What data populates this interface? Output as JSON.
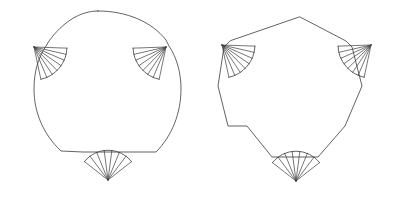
{
  "page": {
    "background_color": "#ffffff",
    "stroke_color": "#3b3b3b",
    "width": 397,
    "height": 198
  },
  "figures": [
    {
      "id": "left-figure",
      "name": "rounded-shield-with-fans",
      "description": "Shield outline with curved top arc and curved sides, three fan pleats",
      "outline_style": "curved",
      "outline_path": "M 98 11 C 127 11 152 22 166 40 L 166 40 L 169 46 C 177 58 181 73 181 89 C 181 113 172 136 156 152 L 133 152 L 83 152 L 61 151 C 43 134 34 112 34 89 C 34 72 38 58 46 46 L 49 41 C 63 22 80 11 98 11 Z",
      "fans": [
        {
          "id": "left-figure-fan-left",
          "name": "fan-upper-left",
          "pivot": [
            34,
            47
          ],
          "radius": 33,
          "start_angle_deg": 2,
          "end_angle_deg": 78,
          "rib_count": 6
        },
        {
          "id": "left-figure-fan-right",
          "name": "fan-upper-right",
          "pivot": [
            166,
            47
          ],
          "radius": 33,
          "start_angle_deg": 102,
          "end_angle_deg": 178,
          "rib_count": 6
        },
        {
          "id": "left-figure-fan-bottom",
          "name": "fan-bottom",
          "pivot": [
            108,
            180
          ],
          "radius": 30,
          "start_angle_deg": 218,
          "end_angle_deg": 322,
          "rib_count": 6
        }
      ]
    },
    {
      "id": "right-figure",
      "name": "angular-shield-with-fans",
      "description": "Shield outline with pointed apex and straight sides, three fan pleats",
      "outline_style": "straight",
      "outline_path": "M 300 17 L 346 41 L 346 41 L 352 47 L 362 86 L 362 86 L 345 126 L 318 157 L 272 157 L 247 126 L 228 126 L 218 86 L 224 47 L 230 41 Z",
      "fans": [
        {
          "id": "right-figure-fan-left",
          "name": "fan-upper-left",
          "pivot": [
            222,
            45
          ],
          "radius": 33,
          "start_angle_deg": 2,
          "end_angle_deg": 78,
          "rib_count": 6
        },
        {
          "id": "right-figure-fan-right",
          "name": "fan-upper-right",
          "pivot": [
            371,
            45
          ],
          "radius": 33,
          "start_angle_deg": 102,
          "end_angle_deg": 178,
          "rib_count": 6
        },
        {
          "id": "right-figure-fan-bottom",
          "name": "fan-bottom",
          "pivot": [
            296,
            181
          ],
          "radius": 30,
          "start_angle_deg": 218,
          "end_angle_deg": 322,
          "rib_count": 6
        }
      ]
    }
  ]
}
